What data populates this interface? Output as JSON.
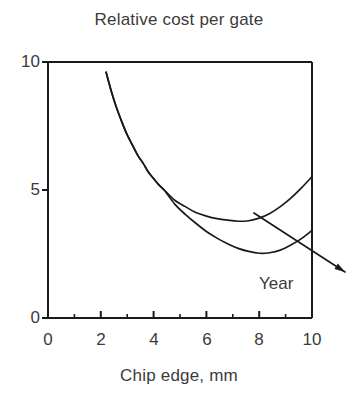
{
  "chart_data": {
    "type": "line",
    "title": "Relative cost per gate",
    "xlabel": "Chip edge, mm",
    "ylabel": "",
    "xlim": [
      0,
      10
    ],
    "ylim": [
      0,
      10
    ],
    "grid": false,
    "legend": "none",
    "xticks": [
      0,
      2,
      4,
      6,
      8,
      10
    ],
    "xtick_labels": [
      "0",
      "2",
      "4",
      "6",
      "8",
      "10"
    ],
    "xminor_ticks": [
      1,
      3,
      5,
      7,
      9
    ],
    "yticks": [
      0,
      5,
      10
    ],
    "ytick_labels": [
      "0",
      "5",
      "10"
    ],
    "annotations": [
      {
        "text": "Year",
        "x": 9.0,
        "y": 1.55,
        "arrow": {
          "from": [
            7.8,
            4.1
          ],
          "to": [
            11.25,
            1.8
          ]
        }
      }
    ],
    "series": [
      {
        "name": "earlier-year-curve",
        "points": [
          [
            2.2,
            9.6
          ],
          [
            2.4,
            8.85
          ],
          [
            2.6,
            8.2
          ],
          [
            2.8,
            7.65
          ],
          [
            3.0,
            7.15
          ],
          [
            3.2,
            6.75
          ],
          [
            3.4,
            6.35
          ],
          [
            3.6,
            6.05
          ],
          [
            3.8,
            5.7
          ],
          [
            4.0,
            5.45
          ],
          [
            4.2,
            5.2
          ],
          [
            4.4,
            5.0
          ],
          [
            4.8,
            4.6
          ],
          [
            5.2,
            4.35
          ],
          [
            5.6,
            4.12
          ],
          [
            6.0,
            3.98
          ],
          [
            6.4,
            3.88
          ],
          [
            6.8,
            3.82
          ],
          [
            7.2,
            3.78
          ],
          [
            7.6,
            3.8
          ],
          [
            8.0,
            3.9
          ],
          [
            8.4,
            4.08
          ],
          [
            8.8,
            4.35
          ],
          [
            9.2,
            4.68
          ],
          [
            9.6,
            5.08
          ],
          [
            10.0,
            5.52
          ]
        ]
      },
      {
        "name": "later-year-curve",
        "points": [
          [
            2.2,
            9.6
          ],
          [
            2.4,
            8.85
          ],
          [
            2.6,
            8.2
          ],
          [
            2.8,
            7.65
          ],
          [
            3.0,
            7.15
          ],
          [
            3.2,
            6.75
          ],
          [
            3.4,
            6.35
          ],
          [
            3.6,
            6.05
          ],
          [
            3.8,
            5.7
          ],
          [
            4.0,
            5.45
          ],
          [
            4.2,
            5.2
          ],
          [
            4.4,
            5.0
          ],
          [
            4.8,
            4.45
          ],
          [
            5.2,
            4.05
          ],
          [
            5.6,
            3.7
          ],
          [
            6.0,
            3.38
          ],
          [
            6.4,
            3.12
          ],
          [
            6.8,
            2.9
          ],
          [
            7.2,
            2.72
          ],
          [
            7.6,
            2.6
          ],
          [
            8.0,
            2.53
          ],
          [
            8.4,
            2.55
          ],
          [
            8.8,
            2.65
          ],
          [
            9.2,
            2.85
          ],
          [
            9.6,
            3.1
          ],
          [
            10.0,
            3.42
          ]
        ]
      }
    ]
  },
  "axis": {
    "y_label_10": "10",
    "y_label_5": "5",
    "y_label_0": "0",
    "x_label_0": "0",
    "x_label_2": "2",
    "x_label_4": "4",
    "x_label_6": "6",
    "x_label_8": "8",
    "x_label_10": "10"
  },
  "colors": {
    "line": "#1a1a1a",
    "text": "#3b3b3b",
    "axis": "#1a1a1a",
    "background": "#ffffff"
  }
}
